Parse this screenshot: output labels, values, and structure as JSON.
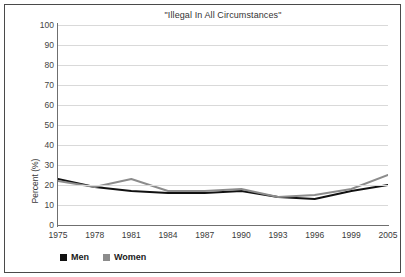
{
  "chart_data": {
    "type": "line",
    "title": "\"Illegal In All Circumstances\"",
    "xlabel": "",
    "ylabel": "Percent (%)",
    "ylim": [
      0,
      100
    ],
    "yticks": [
      0,
      10,
      20,
      30,
      40,
      50,
      60,
      70,
      80,
      90,
      100
    ],
    "categories": [
      "1975",
      "1978",
      "1981",
      "1984",
      "1987",
      "1990",
      "1993",
      "1996",
      "1999",
      "2005"
    ],
    "grid": true,
    "legend_position": "bottom-left",
    "series": [
      {
        "name": "Men",
        "color": "#111111",
        "values": [
          23,
          19,
          17,
          16,
          16,
          17,
          14,
          13,
          17,
          20
        ]
      },
      {
        "name": "Women",
        "color": "#8c8c8c",
        "values": [
          22,
          19,
          23,
          17,
          17,
          18,
          14,
          15,
          18,
          25
        ]
      }
    ]
  },
  "colors": {
    "men": "#111111",
    "women": "#8c8c8c",
    "grid": "#d9d9d9",
    "axis": "#6f6f6f",
    "border": "#4a4a4a"
  },
  "legend": {
    "items": [
      {
        "label": "Men",
        "swatch": "#111111"
      },
      {
        "label": "Women",
        "swatch": "#8c8c8c"
      }
    ]
  }
}
